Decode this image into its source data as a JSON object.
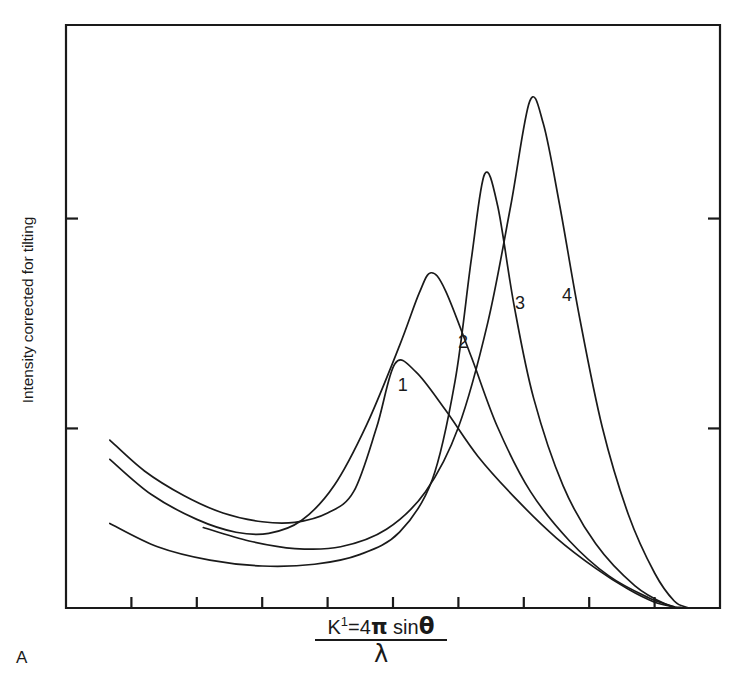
{
  "figure": {
    "panel_label": "A",
    "ylabel": "Intensity corrected for tilting",
    "xlabel_numerator_prefix": "K",
    "xlabel_numerator_sup": "1",
    "xlabel_numerator_eq": "=4",
    "xlabel_numerator_pi": "π",
    "xlabel_numerator_sin": " sin",
    "xlabel_numerator_theta": "θ",
    "xlabel_denominator": "λ",
    "line_color": "#1a1a1a",
    "background_color": "#ffffff"
  },
  "chart_data": {
    "type": "line",
    "title": "",
    "subtitle": "",
    "xlabel": "K¹ = 4π sinθ / λ",
    "ylabel": "Intensity corrected for tilting",
    "grid": false,
    "legend_position": "inline-curve-labels",
    "axis_ticks_labeled": false,
    "xlim": [
      0,
      10
    ],
    "ylim": [
      0,
      10
    ],
    "x_tick_count": 9,
    "x_tick_positions": [
      1.0,
      2.0,
      3.0,
      4.0,
      5.0,
      6.0,
      7.0,
      8.0,
      9.0
    ],
    "y_tick_count": 2,
    "y_tick_positions": [
      3.08,
      6.68
    ],
    "annotations": [
      {
        "text": "1",
        "x": 5.15,
        "y": 3.79
      },
      {
        "text": "2",
        "x": 6.07,
        "y": 4.52
      },
      {
        "text": "3",
        "x": 6.94,
        "y": 5.19
      },
      {
        "text": "4",
        "x": 7.66,
        "y": 5.33
      }
    ],
    "series": [
      {
        "name": "1",
        "label": "1",
        "peak_x": 5.03,
        "peak_y": 4.19,
        "description": "broad low flat peak",
        "points": [
          {
            "x": 0.67,
            "y": 2.88
          },
          {
            "x": 1.2,
            "y": 2.35
          },
          {
            "x": 1.8,
            "y": 1.93
          },
          {
            "x": 2.4,
            "y": 1.63
          },
          {
            "x": 3.0,
            "y": 1.48
          },
          {
            "x": 3.5,
            "y": 1.47
          },
          {
            "x": 4.0,
            "y": 1.63
          },
          {
            "x": 4.4,
            "y": 2.0
          },
          {
            "x": 4.75,
            "y": 3.1
          },
          {
            "x": 5.03,
            "y": 4.19
          },
          {
            "x": 5.35,
            "y": 4.05
          },
          {
            "x": 5.8,
            "y": 3.4
          },
          {
            "x": 6.3,
            "y": 2.6
          },
          {
            "x": 6.9,
            "y": 1.85
          },
          {
            "x": 7.5,
            "y": 1.2
          },
          {
            "x": 8.1,
            "y": 0.68
          },
          {
            "x": 8.6,
            "y": 0.32
          },
          {
            "x": 9.0,
            "y": 0.1
          },
          {
            "x": 9.3,
            "y": 0.02
          }
        ]
      },
      {
        "name": "2",
        "label": "2",
        "peak_x": 5.58,
        "peak_y": 5.75,
        "description": "medium broad peak",
        "points": [
          {
            "x": 0.67,
            "y": 2.55
          },
          {
            "x": 1.3,
            "y": 1.95
          },
          {
            "x": 2.0,
            "y": 1.52
          },
          {
            "x": 2.6,
            "y": 1.3
          },
          {
            "x": 3.1,
            "y": 1.28
          },
          {
            "x": 3.6,
            "y": 1.5
          },
          {
            "x": 4.1,
            "y": 2.1
          },
          {
            "x": 4.6,
            "y": 3.15
          },
          {
            "x": 5.1,
            "y": 4.5
          },
          {
            "x": 5.4,
            "y": 5.4
          },
          {
            "x": 5.58,
            "y": 5.75
          },
          {
            "x": 5.8,
            "y": 5.45
          },
          {
            "x": 6.2,
            "y": 4.3
          },
          {
            "x": 6.6,
            "y": 3.1
          },
          {
            "x": 7.1,
            "y": 2.0
          },
          {
            "x": 7.7,
            "y": 1.15
          },
          {
            "x": 8.3,
            "y": 0.55
          },
          {
            "x": 8.9,
            "y": 0.18
          },
          {
            "x": 9.3,
            "y": 0.02
          }
        ]
      },
      {
        "name": "3",
        "label": "3",
        "peak_x": 6.4,
        "peak_y": 7.44,
        "description": "tall sharp peak",
        "points": [
          {
            "x": 0.67,
            "y": 1.45
          },
          {
            "x": 1.4,
            "y": 1.05
          },
          {
            "x": 2.2,
            "y": 0.82
          },
          {
            "x": 3.0,
            "y": 0.72
          },
          {
            "x": 3.8,
            "y": 0.75
          },
          {
            "x": 4.5,
            "y": 0.92
          },
          {
            "x": 5.1,
            "y": 1.3
          },
          {
            "x": 5.6,
            "y": 2.2
          },
          {
            "x": 5.95,
            "y": 3.9
          },
          {
            "x": 6.2,
            "y": 6.0
          },
          {
            "x": 6.4,
            "y": 7.44
          },
          {
            "x": 6.6,
            "y": 6.9
          },
          {
            "x": 6.85,
            "y": 5.2
          },
          {
            "x": 7.15,
            "y": 3.6
          },
          {
            "x": 7.6,
            "y": 2.1
          },
          {
            "x": 8.1,
            "y": 1.1
          },
          {
            "x": 8.7,
            "y": 0.38
          },
          {
            "x": 9.2,
            "y": 0.05
          },
          {
            "x": 9.4,
            "y": 0.01
          }
        ]
      },
      {
        "name": "4",
        "label": "4",
        "peak_x": 7.09,
        "peak_y": 8.69,
        "description": "tallest sharpest peak, rightmost",
        "points": [
          {
            "x": 2.1,
            "y": 1.38
          },
          {
            "x": 2.8,
            "y": 1.15
          },
          {
            "x": 3.5,
            "y": 1.02
          },
          {
            "x": 4.2,
            "y": 1.05
          },
          {
            "x": 4.9,
            "y": 1.35
          },
          {
            "x": 5.5,
            "y": 2.0
          },
          {
            "x": 6.0,
            "y": 3.1
          },
          {
            "x": 6.45,
            "y": 4.9
          },
          {
            "x": 6.8,
            "y": 6.9
          },
          {
            "x": 7.09,
            "y": 8.69
          },
          {
            "x": 7.3,
            "y": 8.3
          },
          {
            "x": 7.55,
            "y": 6.9
          },
          {
            "x": 7.85,
            "y": 5.0
          },
          {
            "x": 8.2,
            "y": 3.1
          },
          {
            "x": 8.6,
            "y": 1.6
          },
          {
            "x": 9.0,
            "y": 0.6
          },
          {
            "x": 9.3,
            "y": 0.12
          },
          {
            "x": 9.5,
            "y": 0.01
          }
        ]
      }
    ]
  }
}
